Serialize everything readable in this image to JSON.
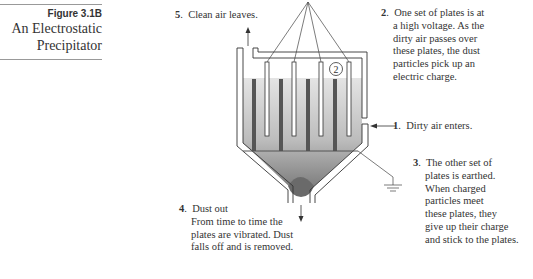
{
  "figure": {
    "number": "Figure 3.1B",
    "title_line1": "An Electrostatic",
    "title_line2": "Precipitator"
  },
  "diagram": {
    "name": "Electrostatic Precipitator",
    "plate_marker": "2",
    "colors": {
      "outline": "#333333",
      "gas_fill_top": "#e2e2e2",
      "gas_fill_bottom": "#8a8a8a",
      "dust_pile": "#6a6a6a",
      "earthed_plates": "#555555",
      "charged_plates": "#ffffff"
    }
  },
  "labels": {
    "step1": {
      "number": "1",
      "lines": [
        "Dirty air enters."
      ]
    },
    "step2": {
      "number": "2",
      "lines": [
        "One set of plates is at",
        "a high voltage. As the",
        "dirty air passes over",
        "these plates, the dust",
        "particles pick up an",
        "electric charge."
      ]
    },
    "step3": {
      "number": "3",
      "lines": [
        "The other set of",
        "plates is earthed.",
        "When charged",
        "particles meet",
        "these plates, they",
        "give up their charge",
        "and stick to the plates."
      ]
    },
    "step4": {
      "number": "4",
      "lines": [
        "Dust out",
        "From time to time the",
        "plates are vibrated. Dust",
        "falls off and is removed."
      ]
    },
    "step5": {
      "number": "5",
      "lines": [
        "Clean air leaves."
      ]
    }
  }
}
